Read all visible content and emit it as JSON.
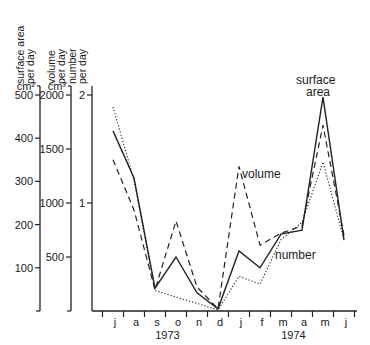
{
  "chart_data": {
    "type": "line",
    "title": "",
    "xlabel": "",
    "categories": [
      "j",
      "a",
      "s",
      "o",
      "n",
      "d",
      "j",
      "f",
      "m",
      "a",
      "m",
      "j"
    ],
    "year_labels": [
      {
        "label": "1973",
        "span": [
          "j",
          "d"
        ]
      },
      {
        "label": "1974",
        "span": [
          "j",
          "j"
        ]
      }
    ],
    "axes": [
      {
        "id": "surface",
        "label_line1": "surface area",
        "label_line2": "per day",
        "unit": "cm²",
        "ticks": [
          100,
          200,
          300,
          400,
          500
        ],
        "ylim": [
          0,
          500
        ]
      },
      {
        "id": "volume",
        "label_line1": "volume",
        "label_line2": "per day",
        "unit": "cm³",
        "ticks": [
          500,
          1000,
          1500,
          2000
        ],
        "ylim": [
          0,
          2000
        ]
      },
      {
        "id": "number",
        "label_line1": "number",
        "label_line2": "per day",
        "unit": "",
        "ticks": [
          1,
          2
        ],
        "ylim": [
          0,
          2
        ]
      }
    ],
    "series": [
      {
        "name": "surface area",
        "axis": "surface",
        "style": "solid",
        "values": [
          417,
          308,
          53,
          125,
          42,
          5,
          139,
          100,
          178,
          187,
          495,
          164
        ]
      },
      {
        "name": "volume",
        "axis": "volume",
        "style": "dashed",
        "values": [
          1400,
          935,
          195,
          833,
          222,
          20,
          1340,
          610,
          720,
          787,
          1720,
          700
        ]
      },
      {
        "name": "number",
        "axis": "number",
        "style": "dotted",
        "values": [
          1.89,
          1.21,
          0.19,
          0.13,
          0.07,
          0.01,
          0.32,
          0.25,
          0.66,
          0.82,
          1.38,
          0.66
        ]
      }
    ],
    "annotations": [
      {
        "text_line1": "surface",
        "text_line2": "area",
        "near": "surface area peak (m 1974)"
      },
      {
        "text": "volume",
        "near": "volume peak (j 1974)"
      },
      {
        "text": "number",
        "near": "number series (f-m 1974)"
      }
    ],
    "grid": false,
    "legend": "none (inline labels)"
  }
}
